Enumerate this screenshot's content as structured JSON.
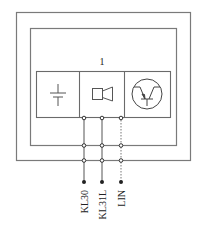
{
  "diagram": {
    "module_label": "1",
    "components": [
      {
        "name": "battery",
        "icon": "battery-icon"
      },
      {
        "name": "horn",
        "icon": "speaker-icon"
      },
      {
        "name": "transistor",
        "icon": "transistor-icon"
      }
    ],
    "terminals": [
      {
        "label": "KL30",
        "line_style": "solid"
      },
      {
        "label": "KL31L",
        "line_style": "solid"
      },
      {
        "label": "LIN",
        "line_style": "dotted"
      }
    ],
    "colors": {
      "line": "#6a6a6a",
      "node": "#333333",
      "background": "#ffffff"
    }
  }
}
